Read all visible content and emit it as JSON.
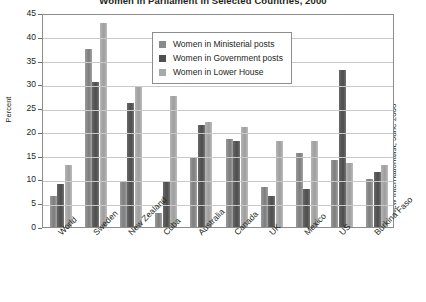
{
  "chart_data": {
    "type": "bar",
    "title": "Women in Parliament in Selected Countries, 2000",
    "xlabel": "",
    "ylabel": "Percent",
    "ylim": [
      0,
      45
    ],
    "ytick_step": 5,
    "yticks": [
      0,
      5,
      10,
      15,
      20,
      25,
      30,
      35,
      40,
      45
    ],
    "grid": true,
    "legend_position": "top-center-inside",
    "source": "New Internationalist, June 2000",
    "categories": [
      "World",
      "Sweden",
      "New Zealand",
      "Cuba",
      "Australia",
      "Canada",
      "UK",
      "Mexico",
      "US",
      "Burkina Faso"
    ],
    "series": [
      {
        "name": "Women in Ministerial posts",
        "color": "#8a8a8a",
        "values": [
          6.5,
          37.5,
          9.5,
          3.0,
          14.5,
          18.5,
          8.5,
          15.5,
          14.0,
          10.0
        ]
      },
      {
        "name": "Women in Government posts",
        "color": "#4f4f4f",
        "values": [
          9.0,
          30.5,
          26.0,
          9.5,
          21.5,
          18.0,
          6.5,
          8.0,
          33.0,
          11.5
        ]
      },
      {
        "name": "Women in Lower House",
        "color": "#a9a9a9",
        "values": [
          13.0,
          43.0,
          29.5,
          27.5,
          22.0,
          21.0,
          18.0,
          18.0,
          13.5,
          13.0
        ]
      }
    ]
  },
  "colors": {
    "plot_border": "#8d8d8d",
    "gridline": "#c9c9c9",
    "text": "#231f20",
    "background": "#ffffff"
  }
}
